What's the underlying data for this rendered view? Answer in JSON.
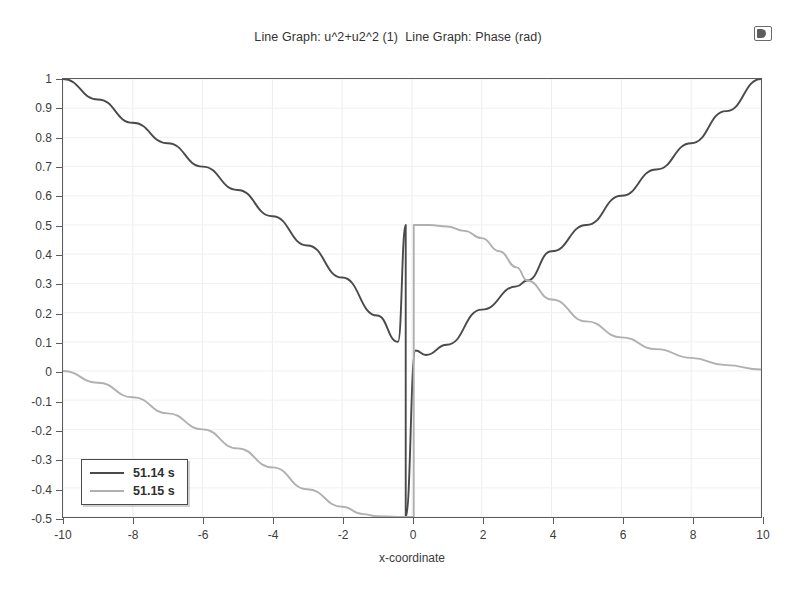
{
  "plot": {
    "title": "Line Graph: u^2+u2^2 (1)  Line Graph: Phase (rad)",
    "corner_icon": "display-window-icon"
  },
  "legend": {
    "items": [
      {
        "label": "51.14 s",
        "color": "#4a4a4a"
      },
      {
        "label": "51.15 s",
        "color": "#b0b0b0"
      }
    ]
  },
  "chart_data": {
    "type": "line",
    "title": "Line Graph: u^2+u2^2 (1)  Line Graph: Phase (rad)",
    "xlabel": "x-coordinate",
    "ylabel": "",
    "xlim": [
      -10,
      10
    ],
    "ylim": [
      -0.5,
      1.0
    ],
    "grid": true,
    "legend_position": "lower-left",
    "xticks": [
      -10,
      -8,
      -6,
      -4,
      -2,
      0,
      2,
      4,
      6,
      8,
      10
    ],
    "xtick_labels": [
      "-10",
      "-8",
      "-6",
      "-4",
      "-2",
      "0",
      "2",
      "4",
      "6",
      "8",
      "10"
    ],
    "yticks": [
      1,
      0.9,
      0.8,
      0.7,
      0.6,
      0.5,
      0.4,
      0.3,
      0.2,
      0.1,
      0,
      -0.1,
      -0.2,
      -0.3,
      -0.4,
      -0.5
    ],
    "ytick_labels": [
      "1",
      "0.9",
      "0.8",
      "0.7",
      "0.6",
      "0.5",
      "0.4",
      "0.3",
      "0.2",
      "0.1",
      "0",
      "-0.1",
      "-0.2",
      "-0.3",
      "-0.4",
      "-0.5"
    ],
    "series": [
      {
        "name": "51.14 s",
        "color": "#4a4a4a",
        "description": "Amplitude u^2+u2^2: descends from 1 at x=-10 to minimum ~0.055 near x=0.3, rises back to 1 at x=10; vertical jump segment at x~-0.18 from -0.5 to 0.5",
        "points": [
          [
            -10,
            1.0
          ],
          [
            -9,
            0.93
          ],
          [
            -8,
            0.85
          ],
          [
            -7,
            0.78
          ],
          [
            -6,
            0.7
          ],
          [
            -5,
            0.62
          ],
          [
            -4,
            0.53
          ],
          [
            -3,
            0.43
          ],
          [
            -2,
            0.32
          ],
          [
            -1,
            0.19
          ],
          [
            -0.4,
            0.1
          ],
          [
            -0.18,
            0.5
          ],
          [
            -0.18,
            -0.5
          ],
          [
            0.1,
            0.07
          ],
          [
            0.4,
            0.055
          ],
          [
            1,
            0.09
          ],
          [
            2,
            0.21
          ],
          [
            3,
            0.29
          ],
          [
            3.3,
            0.31
          ],
          [
            4,
            0.41
          ],
          [
            5,
            0.5
          ],
          [
            6,
            0.6
          ],
          [
            7,
            0.69
          ],
          [
            8,
            0.78
          ],
          [
            9,
            0.89
          ],
          [
            10,
            1.0
          ]
        ]
      },
      {
        "name": "51.15 s",
        "color": "#b0b0b0",
        "description": "Phase (rad): descends from 0 at x=-10 to -0.5 plateau near x=-1..0, vertical jump at x~0.05 up to 0.5, then decays from 0.5 down to 0 at x=10",
        "points": [
          [
            -10,
            0.0
          ],
          [
            -9,
            -0.04
          ],
          [
            -8,
            -0.09
          ],
          [
            -7,
            -0.145
          ],
          [
            -6,
            -0.2
          ],
          [
            -5,
            -0.265
          ],
          [
            -4,
            -0.33
          ],
          [
            -3,
            -0.405
          ],
          [
            -2,
            -0.465
          ],
          [
            -1.4,
            -0.49
          ],
          [
            -1,
            -0.497
          ],
          [
            -0.4,
            -0.5
          ],
          [
            0.05,
            -0.5
          ],
          [
            0.05,
            0.5
          ],
          [
            0.5,
            0.5
          ],
          [
            1,
            0.495
          ],
          [
            1.5,
            0.48
          ],
          [
            2,
            0.455
          ],
          [
            2.5,
            0.41
          ],
          [
            3,
            0.355
          ],
          [
            3.3,
            0.31
          ],
          [
            4,
            0.245
          ],
          [
            5,
            0.17
          ],
          [
            6,
            0.115
          ],
          [
            7,
            0.075
          ],
          [
            8,
            0.045
          ],
          [
            9,
            0.02
          ],
          [
            10,
            0.005
          ]
        ]
      }
    ]
  }
}
